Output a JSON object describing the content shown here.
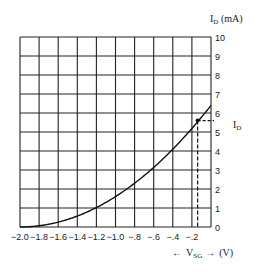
{
  "chart_data": {
    "type": "line",
    "title": "",
    "xlabel": "← V_SG → (V)",
    "ylabel": "I_D (mA)",
    "curve_label": "I_D",
    "xlim": [
      -2.0,
      0
    ],
    "ylim": [
      0,
      10
    ],
    "grid": true,
    "x_tick_labels": [
      "-2.0",
      "-1.8",
      "-1.6",
      "-1.4",
      "-1.2",
      "-1.0",
      "-.8",
      "-.6",
      "-.4",
      "-.2"
    ],
    "y_tick_labels": [
      "0",
      "1",
      "2",
      "3",
      "4",
      "5",
      "6",
      "7",
      "8",
      "9",
      "10"
    ],
    "series": [
      {
        "name": "I_D",
        "x": [
          -2.0,
          -1.8,
          -1.6,
          -1.4,
          -1.2,
          -1.0,
          -0.8,
          -0.6,
          -0.4,
          -0.2,
          0.0
        ],
        "y": [
          0.0,
          0.06,
          0.26,
          0.58,
          1.02,
          1.6,
          2.3,
          3.14,
          4.1,
          5.18,
          6.4
        ]
      }
    ],
    "annotations": [
      {
        "type": "point",
        "x": -0.14,
        "y": 5.6,
        "note": "operating point with dashed projections to both axes"
      }
    ]
  },
  "labels": {
    "y_axis_title": "I",
    "y_axis_sub": "D",
    "y_axis_unit": " (mA)",
    "curve_name": "I",
    "curve_sub": "D",
    "x_axis_left_arrow": "←",
    "x_axis_var": "V",
    "x_axis_sub": "SG",
    "x_axis_right_arrow": "→",
    "x_axis_unit": "(V)"
  }
}
